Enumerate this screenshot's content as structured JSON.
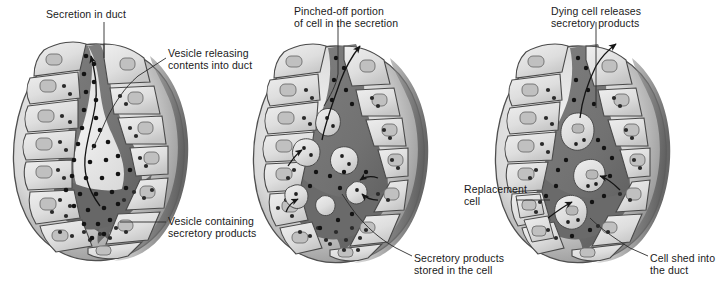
{
  "figure": {
    "background_color": "#ffffff",
    "width": 722,
    "height": 285,
    "panel_count": 3
  },
  "palette": {
    "cell_fill_light": "#e6e6e6",
    "cell_fill_mid": "#d2d2d2",
    "cell_outline": "#4a4a4a",
    "nucleus_fill": "#bdbdbd",
    "nucleus_outline": "#6d6d6d",
    "lumen_fill": "#767676",
    "lumen_dark": "#5f5f5f",
    "granule_color": "#1c1c1c",
    "gland_shadow": "#8a8a8a",
    "gland_shadow_dark": "#6a6a6a",
    "leader_line": "#2b2b2b",
    "text_color": "#1a1a1a"
  },
  "panels": [
    {
      "id": "panel-merocrine",
      "name": "merocrine-secretion-panel",
      "labels": [
        {
          "id": "secretion-in-duct",
          "lines": [
            "Secretion in duct"
          ],
          "x": 46,
          "y": 8,
          "align": "left"
        },
        {
          "id": "vesicle-releasing-contents",
          "lines": [
            "Vesicle releasing",
            "contents into duct"
          ],
          "x": 168,
          "y": 47,
          "align": "left"
        },
        {
          "id": "vesicle-containing-products",
          "lines": [
            "Vesicle containing",
            "secretory products"
          ],
          "x": 168,
          "y": 215,
          "align": "left"
        }
      ]
    },
    {
      "id": "panel-apocrine",
      "name": "apocrine-secretion-panel",
      "labels": [
        {
          "id": "pinched-off-portion",
          "lines": [
            "Pinched-off portion",
            "of cell in the secretion"
          ],
          "x": 294,
          "y": 5,
          "align": "left"
        },
        {
          "id": "secretory-products-stored",
          "lines": [
            "Secretory products",
            "stored in the cell"
          ],
          "x": 414,
          "y": 252,
          "align": "left"
        }
      ]
    },
    {
      "id": "panel-holocrine",
      "name": "holocrine-secretion-panel",
      "labels": [
        {
          "id": "dying-cell-releases",
          "lines": [
            "Dying cell releases",
            "secretory products"
          ],
          "x": 551,
          "y": 5,
          "align": "left"
        },
        {
          "id": "replacement-cell",
          "lines": [
            "Replacement",
            "cell"
          ],
          "x": 464,
          "y": 183,
          "align": "left"
        },
        {
          "id": "cell-shed-into-duct",
          "lines": [
            "Cell shed into",
            "the duct"
          ],
          "x": 650,
          "y": 252,
          "align": "left"
        }
      ]
    }
  ]
}
